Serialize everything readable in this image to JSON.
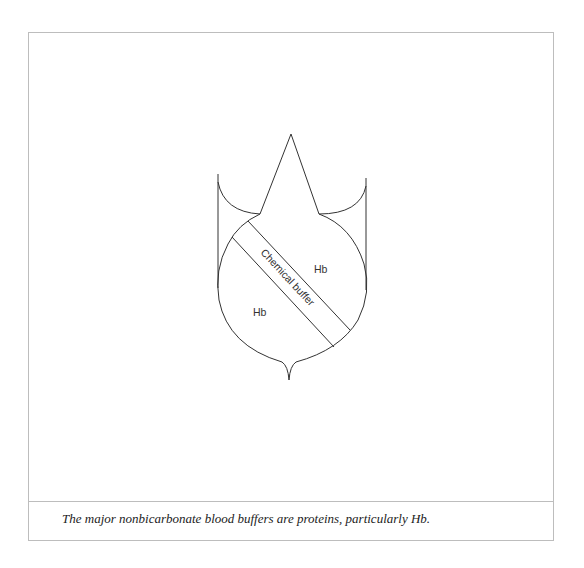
{
  "figure": {
    "labels": {
      "hb_right": "Hb",
      "hb_left": "Hb",
      "band": "Chemical buffer"
    },
    "caption": "The major nonbicarbonate blood buffers are proteins, particularly Hb.",
    "colors": {
      "stroke": "#333333",
      "frame": "#bdbdbd",
      "background": "#ffffff"
    }
  }
}
